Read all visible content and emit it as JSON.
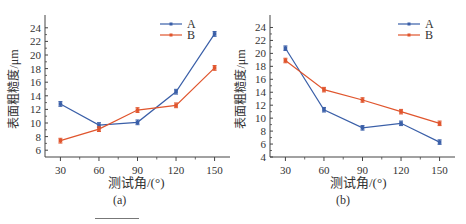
{
  "chart_data": [
    {
      "type": "line",
      "panel_label": "(a)",
      "title": "",
      "xlabel": "测试角/(°)",
      "ylabel": "表面粗糙度/μm",
      "x": [
        30,
        60,
        90,
        120,
        150
      ],
      "xticks": [
        "30",
        "60",
        "90",
        "120",
        "150"
      ],
      "yticks": [
        "6",
        "8",
        "10",
        "12",
        "14",
        "16",
        "18",
        "20",
        "22",
        "24"
      ],
      "ylim": [
        5,
        25
      ],
      "grid": false,
      "legend_position": "upper right",
      "error_bars": true,
      "series": [
        {
          "name": "A",
          "color": "#3a5fa8",
          "values": [
            12.8,
            9.7,
            10.1,
            14.6,
            23.1
          ]
        },
        {
          "name": "B",
          "color": "#e0552d",
          "values": [
            7.4,
            9.1,
            11.9,
            12.6,
            18.1
          ]
        }
      ]
    },
    {
      "type": "line",
      "panel_label": "(b)",
      "title": "",
      "xlabel": "测试角/(°)",
      "ylabel": "表面粗糙度/μm",
      "x": [
        30,
        60,
        90,
        120,
        150
      ],
      "xticks": [
        "30",
        "60",
        "90",
        "120",
        "150"
      ],
      "yticks": [
        "4",
        "6",
        "8",
        "10",
        "12",
        "14",
        "16",
        "18",
        "20",
        "22",
        "24"
      ],
      "ylim": [
        4,
        25
      ],
      "grid": false,
      "legend_position": "upper right",
      "error_bars": true,
      "series": [
        {
          "name": "A",
          "color": "#3a5fa8",
          "values": [
            20.8,
            11.3,
            8.5,
            9.2,
            6.3
          ]
        },
        {
          "name": "B",
          "color": "#e0552d",
          "values": [
            18.9,
            14.4,
            12.8,
            11.0,
            9.2
          ]
        }
      ]
    }
  ]
}
